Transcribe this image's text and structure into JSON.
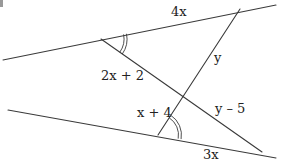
{
  "diagram": {
    "colors": {
      "stroke": "#3a3a3a",
      "text": "#222222",
      "background": "#ffffff"
    },
    "labels": {
      "top_segment": "4x",
      "left_upper_transversal": "2x + 2",
      "right_upper_transversal": "y",
      "left_lower_transversal": "x + 4",
      "right_lower_transversal": "y – 5",
      "bottom_segment": "3x"
    },
    "angle_marks": [
      {
        "name": "upper-left-angle",
        "type": "double-arc"
      },
      {
        "name": "lower-right-angle",
        "type": "double-arc"
      }
    ]
  }
}
